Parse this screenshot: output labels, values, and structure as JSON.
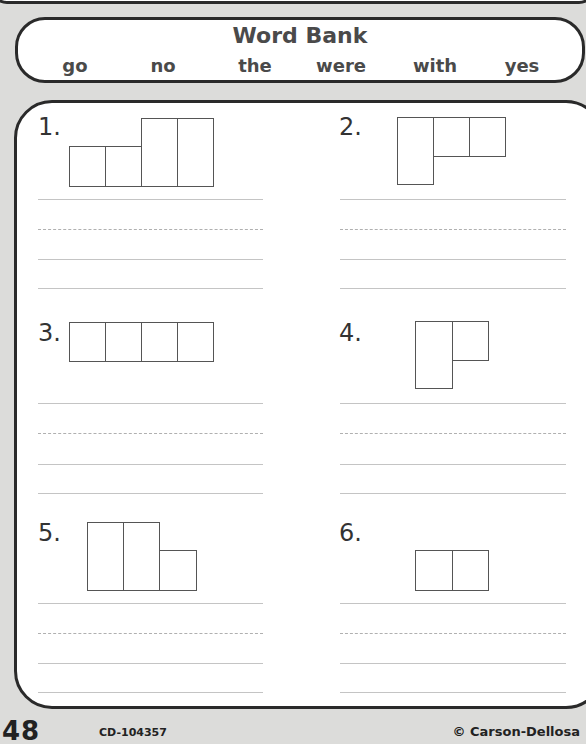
{
  "word_bank": {
    "title": "Word Bank",
    "words": [
      "go",
      "no",
      "the",
      "were",
      "with",
      "yes"
    ]
  },
  "exercises": [
    {
      "number": "1.",
      "shape": "short-short-tall-tall"
    },
    {
      "number": "2.",
      "shape": "tall-short-short"
    },
    {
      "number": "3.",
      "shape": "short-short-short-short"
    },
    {
      "number": "4.",
      "shape": "tall-short"
    },
    {
      "number": "5.",
      "shape": "tall-tall-short"
    },
    {
      "number": "6.",
      "shape": "short-short"
    }
  ],
  "footer": {
    "page_number": "48",
    "product_code": "CD-104357",
    "copyright": "© Carson-Dellosa"
  }
}
